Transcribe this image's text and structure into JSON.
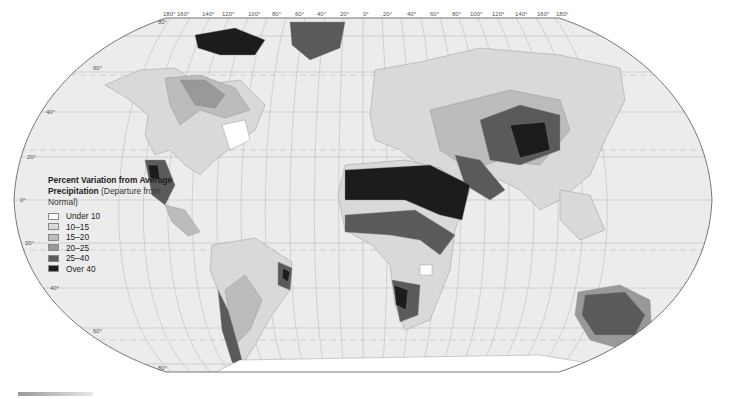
{
  "map": {
    "title": "Percent Variation from Average Precipitation",
    "title_sub": "(Departure from Normal)",
    "projection": "Robinson",
    "longitude_labels": [
      "180°",
      "160°",
      "140°",
      "120°",
      "100°",
      "80°",
      "60°",
      "40°",
      "20°",
      "0°",
      "20°",
      "40°",
      "60°",
      "80°",
      "100°",
      "120°",
      "140°",
      "160°",
      "180°"
    ],
    "latitude_labels": [
      "80°",
      "60°",
      "40°",
      "20°",
      "0°",
      "20°",
      "40°",
      "60°",
      "80°"
    ],
    "colors": {
      "ocean": "#ececec",
      "graticule": "#b8b8b8",
      "border": "#555555"
    }
  },
  "legend": {
    "title_bold": "Percent Variation from Average Precipitation",
    "title_sub": "(Departure from Normal)",
    "items": [
      {
        "label": "Under 10",
        "color": "#ffffff"
      },
      {
        "label": "10–15",
        "color": "#d9d9d9"
      },
      {
        "label": "15–20",
        "color": "#bcbcbc"
      },
      {
        "label": "20–25",
        "color": "#999999"
      },
      {
        "label": "25–40",
        "color": "#5a5a5a"
      },
      {
        "label": "Over 40",
        "color": "#1c1c1c"
      }
    ]
  }
}
